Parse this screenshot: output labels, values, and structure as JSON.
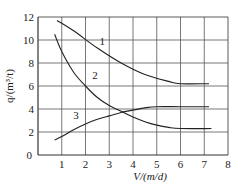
{
  "chart_data": {
    "type": "line",
    "title": "",
    "xlabel": "V/(m/d)",
    "ylabel": "q/(m³/t)",
    "xlim": [
      0,
      8
    ],
    "ylim": [
      0,
      12
    ],
    "x_ticks": [
      1,
      2,
      3,
      4,
      5,
      6,
      7,
      8
    ],
    "y_ticks": [
      0,
      2,
      4,
      6,
      8,
      10,
      12
    ],
    "grid": true,
    "legend": "inline curve labels",
    "series": [
      {
        "name": "1",
        "x": [
          0.8,
          1.5,
          2.5,
          3.5,
          4.5,
          5.5,
          6.0,
          7.2
        ],
        "y": [
          11.7,
          10.8,
          9.3,
          8.0,
          7.0,
          6.4,
          6.2,
          6.2
        ],
        "label_pos": [
          2.7,
          9.6
        ]
      },
      {
        "name": "2",
        "x": [
          0.7,
          1.0,
          1.5,
          2.0,
          2.5,
          3.0,
          3.5,
          4.0,
          4.5,
          5.0,
          5.5,
          6.0,
          7.3
        ],
        "y": [
          10.5,
          9.0,
          7.2,
          6.0,
          5.0,
          4.3,
          3.8,
          3.3,
          2.9,
          2.6,
          2.4,
          2.3,
          2.3
        ],
        "label_pos": [
          2.4,
          6.6
        ]
      },
      {
        "name": "3",
        "x": [
          0.7,
          1.0,
          1.5,
          2.0,
          2.5,
          3.0,
          3.5,
          4.0,
          4.5,
          5.0,
          6.0,
          7.2
        ],
        "y": [
          1.3,
          1.6,
          2.2,
          2.7,
          3.1,
          3.4,
          3.7,
          3.9,
          4.1,
          4.2,
          4.2,
          4.2
        ],
        "label_pos": [
          1.6,
          3.1
        ]
      }
    ]
  }
}
